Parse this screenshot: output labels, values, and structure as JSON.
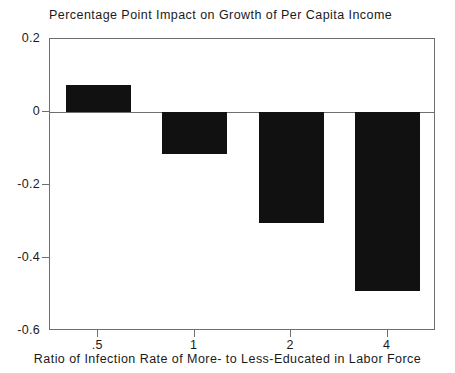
{
  "chart_data": {
    "type": "bar",
    "title": "Percentage Point Impact on Growth of Per Capita Income",
    "xlabel": "Ratio of Infection Rate of More- to Less-Educated in Labor Force",
    "ylabel": "",
    "categories": [
      ".5",
      "1",
      "2",
      "4"
    ],
    "values": [
      0.075,
      -0.115,
      -0.305,
      -0.49
    ],
    "series": [
      {
        "name": "Percentage point impact",
        "values": [
          0.075,
          -0.115,
          -0.305,
          -0.49
        ]
      }
    ],
    "ylim": [
      -0.6,
      0.2
    ],
    "ytick_labels": [
      "0.2",
      "0",
      "-0.2",
      "-0.4",
      "-0.6"
    ],
    "ytick_values": [
      0.2,
      0,
      -0.2,
      -0.4,
      -0.6
    ],
    "xtick_labels": [
      ".5",
      "1",
      "2",
      "4"
    ],
    "grid": false,
    "legend": false,
    "bar_color": "#111111",
    "axis_color": "#6f6f6f",
    "background_color": "#ffffff",
    "zero_line": true
  }
}
